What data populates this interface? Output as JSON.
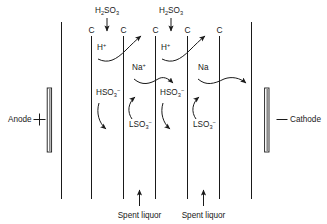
{
  "figure": {
    "type": "electrodialysis-cell-diagram",
    "background_color": "#ffffff",
    "line_color": "#1a1a1a"
  },
  "electrodes": {
    "anode": {
      "label": "Anode",
      "polarity_symbol": "+",
      "position": "left"
    },
    "cathode": {
      "label": "Cathode",
      "polarity_symbol": "—",
      "position": "right"
    }
  },
  "membranes": {
    "label": "C",
    "count": 5,
    "labels": [
      "C",
      "C",
      "C",
      "C",
      "C"
    ]
  },
  "feeds": {
    "acid": [
      {
        "label": "H₂SO₃",
        "base": "H",
        "sub1": "2",
        "mid": "SO",
        "sub2": "3"
      },
      {
        "label": "H₂SO₃",
        "base": "H",
        "sub1": "2",
        "mid": "SO",
        "sub2": "3"
      }
    ],
    "bottom": [
      {
        "label": "Spent liquor"
      },
      {
        "label": "Spent liquor"
      }
    ]
  },
  "species": {
    "proton": [
      {
        "base": "H",
        "sup": "+",
        "label": "H⁺"
      },
      {
        "base": "H",
        "sup": "+",
        "label": "H⁺"
      }
    ],
    "sodium": [
      {
        "base": "Na",
        "sup": "+",
        "label": "Na⁺"
      },
      {
        "base": "Na",
        "sup": "",
        "label": "Na"
      }
    ],
    "bisulfite": [
      {
        "base": "HSO",
        "sub": "3",
        "sup": "−",
        "label": "HSO₃⁻"
      },
      {
        "base": "HSO",
        "sub": "3",
        "sup": "−",
        "label": "HSO₃⁻"
      }
    ],
    "lignosulfonate": [
      {
        "base": "LSO",
        "sub": "3",
        "sup": "−",
        "label": "LSO₃⁻"
      },
      {
        "base": "LSO",
        "sub": "3",
        "sup": "−",
        "label": "LSO₃⁻"
      }
    ]
  }
}
